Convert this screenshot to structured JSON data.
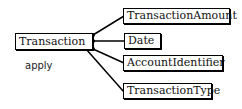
{
  "diagram": {
    "root": {
      "label": "Transaction"
    },
    "annotation": "apply",
    "children": [
      {
        "label": "TransactionAmount"
      },
      {
        "label": "Date"
      },
      {
        "label": "AccountIdentifier"
      },
      {
        "label": "TransactionType"
      }
    ],
    "colors": {
      "line": "#000000",
      "box_border": "#000000",
      "background": "#ffffff"
    }
  }
}
